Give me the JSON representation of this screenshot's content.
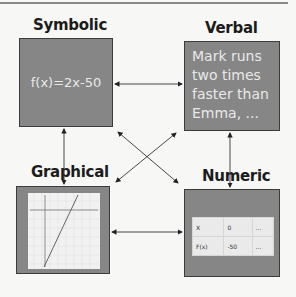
{
  "diagram": {
    "nodes": [
      {
        "id": "symbolic",
        "title": "Symbolic",
        "content": "f(x)=2x-50"
      },
      {
        "id": "verbal",
        "title": "Verbal",
        "content_lines": [
          "Mark runs",
          "two times",
          "faster than",
          "Emma, ..."
        ]
      },
      {
        "id": "graphical",
        "title": "Graphical",
        "content": "line graph of f(x)=2x-50"
      },
      {
        "id": "numeric",
        "title": "Numeric",
        "table": {
          "rows": [
            [
              "X",
              "0",
              "..."
            ],
            [
              "F(x)",
              "-50",
              "..."
            ]
          ]
        }
      }
    ],
    "edges": [
      {
        "from": "symbolic",
        "to": "verbal",
        "bidirectional": true
      },
      {
        "from": "symbolic",
        "to": "graphical",
        "bidirectional": true
      },
      {
        "from": "verbal",
        "to": "numeric",
        "bidirectional": true
      },
      {
        "from": "graphical",
        "to": "numeric",
        "bidirectional": true
      },
      {
        "from": "symbolic",
        "to": "numeric",
        "bidirectional": true
      },
      {
        "from": "verbal",
        "to": "graphical",
        "bidirectional": true
      }
    ],
    "colors": {
      "box_fill": "#868686",
      "box_border": "#3c3c3c",
      "box_text": "#e9e9e9",
      "arrow": "#333333"
    }
  }
}
